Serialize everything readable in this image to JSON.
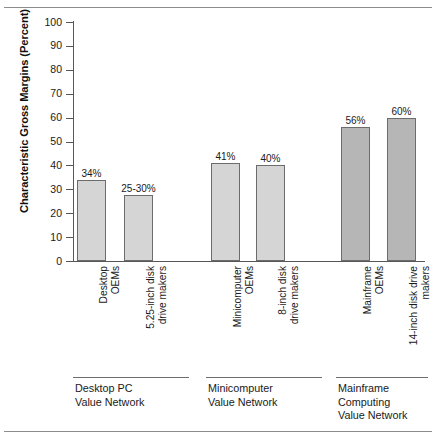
{
  "chart_data": {
    "type": "bar",
    "title": "",
    "xlabel": "",
    "ylabel": "Characteristic Gross Margins (Percent)",
    "ylim": [
      0,
      100
    ],
    "yticks": [
      0,
      10,
      20,
      30,
      40,
      50,
      60,
      70,
      80,
      90,
      100
    ],
    "ytick_labels": [
      "0",
      "10",
      "20",
      "30",
      "40",
      "50",
      "60",
      "70",
      "80",
      "90",
      "100"
    ],
    "grid": false,
    "legend": "none",
    "categories": [
      "Desktop\nOEMs",
      "5.25-inch disk\ndrive makers",
      "Minicomputer\nOEMs",
      "8-inch disk\ndrive makers",
      "Mainframe\nOEMs",
      "14-inch disk drive\nmakers"
    ],
    "values": [
      34,
      27.5,
      41,
      40,
      56,
      60
    ],
    "data_labels": [
      "34%",
      "25-30%",
      "41%",
      "40%",
      "56%",
      "60%"
    ],
    "bars": [
      {
        "label": "Desktop\nOEMs",
        "data_label": "34%",
        "value": 34,
        "group": 0,
        "shade": "light"
      },
      {
        "label": "5.25-inch disk\ndrive makers",
        "data_label": "25-30%",
        "value": 27.5,
        "group": 0,
        "shade": "light"
      },
      {
        "label": "Minicomputer\nOEMs",
        "data_label": "41%",
        "value": 41,
        "group": 1,
        "shade": "light"
      },
      {
        "label": "8-inch disk\ndrive makers",
        "data_label": "40%",
        "value": 40,
        "group": 1,
        "shade": "light"
      },
      {
        "label": "Mainframe\nOEMs",
        "data_label": "56%",
        "value": 56,
        "group": 2,
        "shade": "dark"
      },
      {
        "label": "14-inch disk drive\nmakers",
        "data_label": "60%",
        "value": 60,
        "group": 2,
        "shade": "dark"
      }
    ],
    "groups": [
      {
        "caption": "Desktop PC\nValue Network"
      },
      {
        "caption": "Minicomputer\nValue Network"
      },
      {
        "caption": "Mainframe\nComputing\nValue Network"
      }
    ],
    "colors": {
      "bar_light": "#d5d5d5",
      "bar_dark": "#b6b6b6",
      "bar_border": "#6c6c6c",
      "axis": "#55585a",
      "text": "#1a1a1a",
      "rule": "#8d8d8d",
      "background": "#ffffff"
    }
  }
}
